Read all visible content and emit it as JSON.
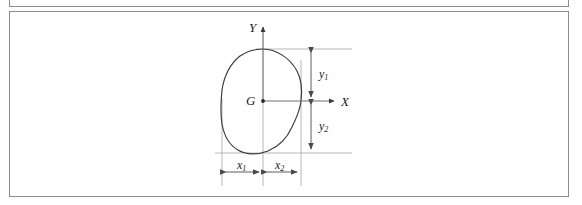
{
  "figure": {
    "kind": "engineering-diagram",
    "frame": {
      "border_color": "#8d8d8d",
      "background": "#ffffff"
    },
    "line_color": "#3a3a3a",
    "dimension_color": "#6f6f6f",
    "labels": {
      "axis_y": "Y",
      "axis_x": "X",
      "centroid": "G",
      "dim_y1_base": "y",
      "dim_y1_sub": "1",
      "dim_y2_base": "y",
      "dim_y2_sub": "2",
      "dim_x1_base": "x",
      "dim_x1_sub": "1",
      "dim_x2_base": "x",
      "dim_x2_sub": "2"
    },
    "geometry": {
      "origin": {
        "x": 263,
        "y": 101
      },
      "y_axis_arrow_tip": {
        "x": 263,
        "y": 24
      },
      "x_axis_arrow_tip": {
        "x": 337,
        "y": 101
      },
      "blob_top": {
        "x": 263,
        "y": 49
      },
      "blob_bottom": {
        "x": 250,
        "y": 153
      },
      "blob_left": {
        "x": 222,
        "y": 100
      },
      "blob_right": {
        "x": 301,
        "y": 101
      },
      "vertical_dim_line_x": 311,
      "horizontal_dim_line_y": 172
    }
  }
}
